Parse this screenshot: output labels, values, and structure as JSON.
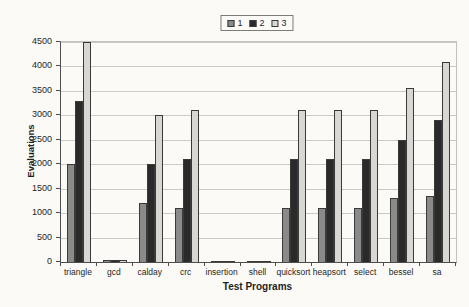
{
  "figure": {
    "background": "#fbfaf7"
  },
  "legend": {
    "items": [
      {
        "label": "1",
        "color": "#8a8a8a"
      },
      {
        "label": "2",
        "color": "#2a2a2a"
      },
      {
        "label": "3",
        "color": "#d9d7d3"
      }
    ]
  },
  "chart_data": {
    "type": "bar",
    "title": "",
    "xlabel": "Test Programs",
    "ylabel": "Evaluations",
    "ylim": [
      0,
      4500
    ],
    "ytick_step": 500,
    "ytick_labels": [
      "0",
      "500",
      "1000",
      "1500",
      "2000",
      "2500",
      "3000",
      "3500",
      "4000",
      "4500"
    ],
    "grid": true,
    "legend_position": "top-center",
    "categories": [
      "triangle",
      "gcd",
      "calday",
      "crc",
      "insertion",
      "shell",
      "quicksort",
      "heapsort",
      "select",
      "bessel",
      "sa"
    ],
    "series": [
      {
        "name": "1",
        "color": "#8a8a8a",
        "values": [
          2000,
          50,
          1200,
          1100,
          20,
          20,
          1100,
          1100,
          1100,
          1300,
          1350
        ]
      },
      {
        "name": "2",
        "color": "#2a2a2a",
        "values": [
          3300,
          50,
          2000,
          2100,
          20,
          20,
          2100,
          2100,
          2100,
          2500,
          2900
        ]
      },
      {
        "name": "3",
        "color": "#d9d7d3",
        "values": [
          4500,
          50,
          3000,
          3100,
          20,
          20,
          3100,
          3100,
          3100,
          3550,
          4100
        ]
      }
    ]
  }
}
